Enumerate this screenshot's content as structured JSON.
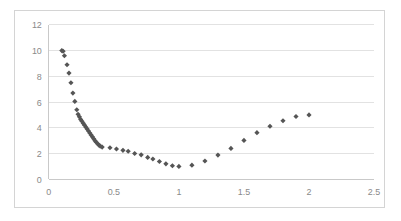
{
  "chart_data": {
    "type": "scatter",
    "title": "",
    "xlabel": "",
    "ylabel": "",
    "xlim": [
      0,
      2.5
    ],
    "ylim": [
      0,
      12
    ],
    "xticks": [
      "0",
      "0.5",
      "1",
      "1.5",
      "2",
      "2.5"
    ],
    "xtick_values": [
      0,
      0.5,
      1,
      1.5,
      2,
      2.5
    ],
    "yticks": [
      "0",
      "2",
      "4",
      "6",
      "8",
      "10",
      "12"
    ],
    "ytick_values": [
      0,
      2,
      4,
      6,
      8,
      10,
      12
    ],
    "grid": "horizontal",
    "legend": "none",
    "marker": "diamond",
    "marker_color": "#555555",
    "series": [
      {
        "name": "series-1",
        "points": [
          [
            0.1,
            10.0
          ],
          [
            0.11,
            9.95
          ],
          [
            0.12,
            9.6
          ],
          [
            0.14,
            8.9
          ],
          [
            0.155,
            8.25
          ],
          [
            0.17,
            7.5
          ],
          [
            0.185,
            6.7
          ],
          [
            0.2,
            6.05
          ],
          [
            0.215,
            5.4
          ],
          [
            0.225,
            5.05
          ],
          [
            0.235,
            4.85
          ],
          [
            0.245,
            4.65
          ],
          [
            0.255,
            4.5
          ],
          [
            0.265,
            4.35
          ],
          [
            0.275,
            4.2
          ],
          [
            0.285,
            4.05
          ],
          [
            0.295,
            3.9
          ],
          [
            0.305,
            3.75
          ],
          [
            0.315,
            3.6
          ],
          [
            0.325,
            3.45
          ],
          [
            0.335,
            3.3
          ],
          [
            0.345,
            3.15
          ],
          [
            0.355,
            3.0
          ],
          [
            0.365,
            2.88
          ],
          [
            0.375,
            2.76
          ],
          [
            0.385,
            2.66
          ],
          [
            0.395,
            2.58
          ],
          [
            0.41,
            2.5
          ],
          [
            0.47,
            2.45
          ],
          [
            0.52,
            2.35
          ],
          [
            0.57,
            2.25
          ],
          [
            0.61,
            2.18
          ],
          [
            0.66,
            2.0
          ],
          [
            0.71,
            1.9
          ],
          [
            0.76,
            1.7
          ],
          [
            0.8,
            1.58
          ],
          [
            0.85,
            1.38
          ],
          [
            0.9,
            1.2
          ],
          [
            0.95,
            1.05
          ],
          [
            1.0,
            1.0
          ],
          [
            1.1,
            1.1
          ],
          [
            1.2,
            1.42
          ],
          [
            1.3,
            1.88
          ],
          [
            1.4,
            2.4
          ],
          [
            1.5,
            3.02
          ],
          [
            1.6,
            3.62
          ],
          [
            1.7,
            4.12
          ],
          [
            1.8,
            4.55
          ],
          [
            1.9,
            4.88
          ],
          [
            2.0,
            5.0
          ]
        ]
      }
    ]
  }
}
